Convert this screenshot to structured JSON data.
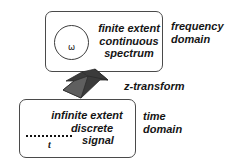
{
  "diagram": {
    "background_color": "#ffffff",
    "box_border_color": "#4a4a4a",
    "arrow_color": "#3b3b3b",
    "arrow_facet_color": "#6e6e6e",
    "text_color": "#151515"
  },
  "frequency_box": {
    "symbol": "ω",
    "line1": "finite extent",
    "line2": "continuous",
    "line3": "spectrum",
    "side_label_line1": "frequency",
    "side_label_line2": "domain"
  },
  "transform": {
    "label": "z-transform",
    "direction": "upward"
  },
  "time_box": {
    "line1": "infinite extent",
    "line2": "discrete",
    "line3": "signal",
    "axis_label": "t",
    "axis_dot_count": 12,
    "side_label_line1": "time",
    "side_label_line2": "domain"
  }
}
